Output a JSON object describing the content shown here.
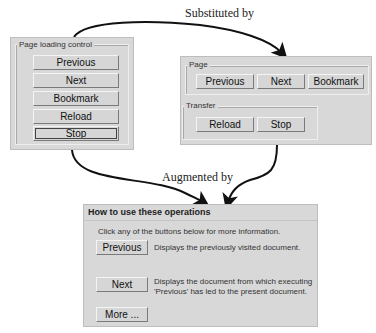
{
  "captions": {
    "substituted": "Substituted by",
    "augmented": "Augmented by"
  },
  "left_panel": {
    "legend": "Page loading control",
    "buttons": [
      {
        "label": "Previous"
      },
      {
        "label": "Next"
      },
      {
        "label": "Bookmark"
      },
      {
        "label": "Reload"
      },
      {
        "label": "Stop"
      }
    ]
  },
  "right_panel": {
    "page_group": {
      "legend": "Page",
      "buttons": [
        {
          "label": "Previous"
        },
        {
          "label": "Next"
        },
        {
          "label": "Bookmark"
        }
      ]
    },
    "transfer_group": {
      "legend": "Transfer",
      "buttons": [
        {
          "label": "Reload"
        },
        {
          "label": "Stop"
        }
      ]
    }
  },
  "help_panel": {
    "title": "How to use these operations",
    "intro": "Click any of the buttons below for more information.",
    "items": [
      {
        "button": "Previous",
        "description": "Displays the previously visited document."
      },
      {
        "button": "Next",
        "description_line1": "Displays the document from which executing",
        "description_line2": "'Previous' has led to the present document."
      }
    ],
    "more_button": "More ..."
  }
}
